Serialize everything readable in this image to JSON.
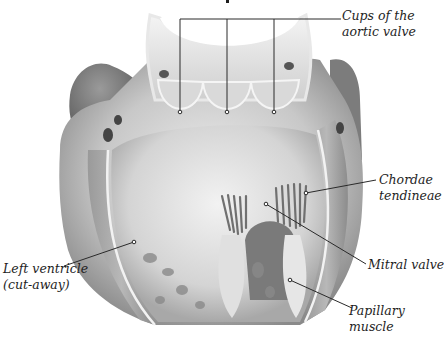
{
  "diagram": {
    "colors": {
      "background": "#ffffff",
      "tissue_light": "#e6e6e6",
      "tissue_mid": "#b5b5b5",
      "tissue_dark": "#6e6e6e",
      "leader_line": "#2a2a2a",
      "label_text": "#1e1e1e"
    },
    "labels": [
      {
        "id": "cups-aortic-valve",
        "lines": [
          "Cups of the",
          "aortic valve"
        ]
      },
      {
        "id": "chordae-tendineae",
        "lines": [
          "Chordae",
          "tendineae"
        ]
      },
      {
        "id": "left-ventricle",
        "lines": [
          "Left ventricle",
          "(cut-away)"
        ]
      },
      {
        "id": "mitral-valve",
        "lines": [
          "Mitral valve"
        ]
      },
      {
        "id": "papillary-muscle",
        "lines": [
          "Papillary",
          "muscle"
        ]
      }
    ]
  }
}
